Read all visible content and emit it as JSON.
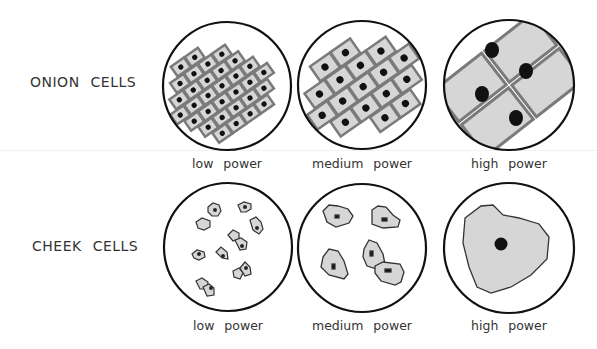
{
  "rows": [
    {
      "label": "ONION CELLS",
      "panels": [
        {
          "caption": "low power"
        },
        {
          "caption": "medium power"
        },
        {
          "caption": "high power"
        }
      ]
    },
    {
      "label": "CHEEK CELLS",
      "panels": [
        {
          "caption": "low power"
        },
        {
          "caption": "medium power"
        },
        {
          "caption": "high power"
        }
      ]
    }
  ],
  "colors": {
    "cell_fill": "#d6d6d6",
    "onion_cell_border": "#7a7a7a",
    "cheek_cell_border": "#333333",
    "nucleus": "#111111",
    "field_outline": "#111111"
  }
}
